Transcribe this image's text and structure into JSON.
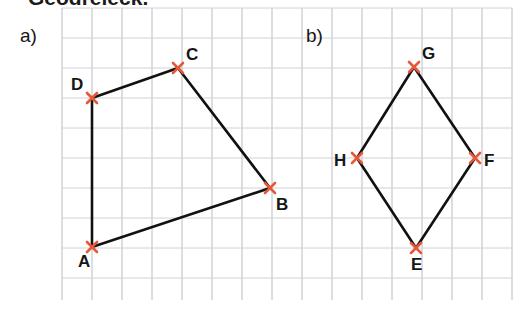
{
  "page": {
    "width": 525,
    "height": 332,
    "background": "#ffffff",
    "heading_partial": "Geodreieck.",
    "part_a_label": "a)",
    "part_b_label": "b)"
  },
  "style": {
    "grid_color": "#b9bcc4",
    "grid_faint_color": "#cfd2d8",
    "edge_color": "#111111",
    "vertex_marker_color": "#e3593a",
    "label_color": "#161616",
    "grid_spacing": 30
  },
  "grid": {
    "x_start": 62,
    "x_end": 512,
    "y_start": 8,
    "y_end": 300,
    "vertical_lines": [
      62,
      92,
      122,
      152,
      182,
      212,
      242,
      272,
      302,
      332,
      362,
      392,
      422,
      452,
      482,
      512
    ],
    "horizontal_lines": [
      8,
      38,
      68,
      98,
      128,
      158,
      188,
      218,
      248,
      278
    ]
  },
  "figures": [
    {
      "id": "figure-a",
      "label": "a)",
      "label_pos": {
        "x": 20,
        "y": 42
      },
      "type": "quadrilateral",
      "closed": true,
      "vertices": [
        {
          "name": "A",
          "x": 92,
          "y": 247,
          "label_dx": -14,
          "label_dy": 20
        },
        {
          "name": "B",
          "x": 270,
          "y": 188,
          "label_dx": 6,
          "label_dy": 22
        },
        {
          "name": "C",
          "x": 178,
          "y": 68,
          "label_dx": 8,
          "label_dy": -8
        },
        {
          "name": "D",
          "x": 92,
          "y": 98,
          "label_dx": -21,
          "label_dy": -8
        }
      ],
      "edges": [
        [
          "A",
          "B"
        ],
        [
          "B",
          "C"
        ],
        [
          "C",
          "D"
        ],
        [
          "D",
          "A"
        ]
      ]
    },
    {
      "id": "figure-b",
      "label": "b)",
      "label_pos": {
        "x": 306,
        "y": 42
      },
      "type": "rhombus",
      "closed": true,
      "vertices": [
        {
          "name": "E",
          "x": 416,
          "y": 248,
          "label_dx": -5,
          "label_dy": 22
        },
        {
          "name": "F",
          "x": 475,
          "y": 158,
          "label_dx": 9,
          "label_dy": 8
        },
        {
          "name": "G",
          "x": 414,
          "y": 67,
          "label_dx": 8,
          "label_dy": -8
        },
        {
          "name": "H",
          "x": 357,
          "y": 158,
          "label_dx": -23,
          "label_dy": 8
        }
      ],
      "edges": [
        [
          "E",
          "F"
        ],
        [
          "F",
          "G"
        ],
        [
          "G",
          "H"
        ],
        [
          "H",
          "E"
        ]
      ]
    }
  ]
}
